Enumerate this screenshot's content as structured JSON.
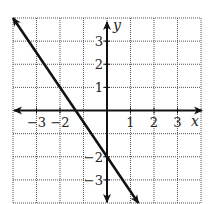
{
  "chart_data": {
    "type": "line",
    "title": "",
    "xlabel": "x",
    "ylabel": "y",
    "xlim": [
      -4,
      4
    ],
    "ylim": [
      -4,
      4
    ],
    "grid": true,
    "grid_style": "dotted",
    "x_ticks": [
      {
        "value": -3,
        "label": "−3"
      },
      {
        "value": -2,
        "label": "−2"
      },
      {
        "value": 1,
        "label": "1"
      },
      {
        "value": 2,
        "label": "2"
      },
      {
        "value": 3,
        "label": "3"
      }
    ],
    "y_ticks": [
      {
        "value": 3,
        "label": "3"
      },
      {
        "value": 2,
        "label": "2"
      },
      {
        "value": 1,
        "label": "1"
      },
      {
        "value": -2,
        "label": "−2"
      },
      {
        "value": -3,
        "label": "−3"
      }
    ],
    "series": [
      {
        "name": "line",
        "equation": "y = -1.5x - 2",
        "slope": -1.5,
        "intercept": -2,
        "x": [
          -4,
          1.333
        ],
        "y": [
          4,
          -4
        ],
        "arrows": "both",
        "color": "#111111"
      }
    ],
    "legend": null
  },
  "colors": {
    "line": "#111111",
    "axis": "#111111",
    "grid": "#555555",
    "background": "#ffffff"
  }
}
